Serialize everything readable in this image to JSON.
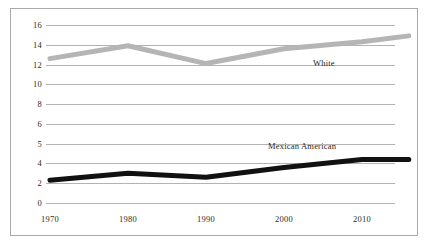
{
  "chart_data": {
    "type": "line",
    "title": "",
    "subtitle": "",
    "xlabel": "",
    "ylabel": "",
    "x": [
      1970,
      1980,
      1990,
      2000,
      2010,
      2016
    ],
    "xlim": [
      1966,
      2018
    ],
    "ylim": [
      0,
      16
    ],
    "grid": true,
    "legend_position": "inline-annotation",
    "x_tick_labels": [
      "1970",
      "1980",
      "1990",
      "2000",
      "2010"
    ],
    "x_tick_values": [
      1970,
      1980,
      1990,
      2000,
      2010
    ],
    "y_tick_labels": [
      "16",
      "14",
      "12",
      "10",
      "8",
      "6",
      "5",
      "4",
      "2",
      "0"
    ],
    "y_tick_values": [
      16,
      14,
      12,
      10,
      8,
      6,
      5,
      4,
      2,
      0
    ],
    "y_axis_note": "tick labels are evenly spaced but not linearly valued (extra tick at 5)",
    "series": [
      {
        "name": "White",
        "color": "#b5b5b5",
        "label_text": "White",
        "values": [
          12.6,
          13.9,
          12.1,
          13.6,
          14.3,
          14.9
        ]
      },
      {
        "name": "Mexican American",
        "color": "#111111",
        "label_text": "Mexican American",
        "values": [
          2.3,
          3.0,
          2.6,
          3.6,
          4.2,
          4.2
        ]
      }
    ]
  },
  "frame": {
    "border_color": "#a9a9a9",
    "gridline_color": "#b3b3b3",
    "background": "#ffffff"
  }
}
